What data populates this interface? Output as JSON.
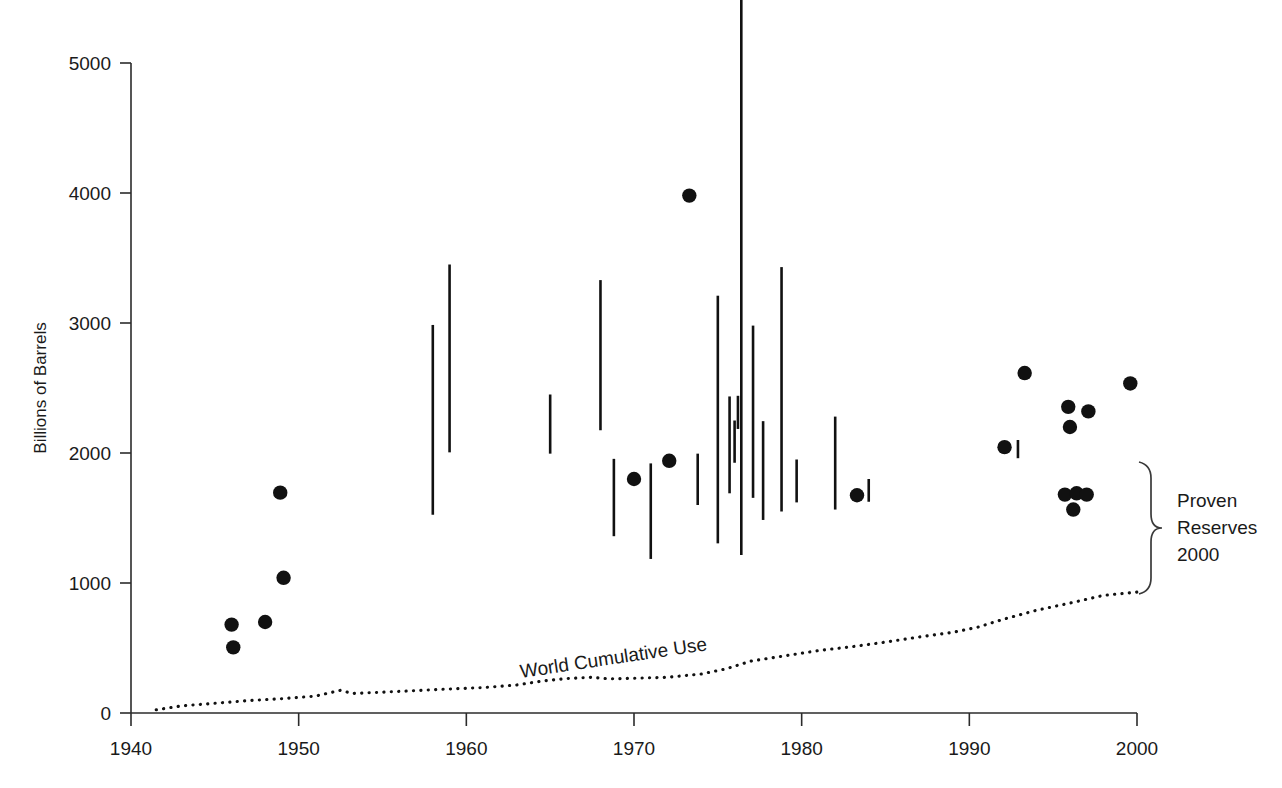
{
  "chart_data": {
    "type": "scatter",
    "title": "",
    "xlabel": "",
    "ylabel": "Billions of Barrels",
    "xlim": [
      1940,
      2000
    ],
    "ylim": [
      0,
      5000
    ],
    "xticks": [
      1940,
      1950,
      1960,
      1970,
      1980,
      1990,
      2000
    ],
    "yticks": [
      0,
      1000,
      2000,
      3000,
      4000,
      5000
    ],
    "grid": false,
    "legend_position": "none",
    "series": [
      {
        "name": "Point estimates of ultimately recoverable resources",
        "type": "scatter",
        "marker": "filled-circle",
        "color": "#111111",
        "points": [
          {
            "x": 1946.0,
            "y": 680
          },
          {
            "x": 1946.1,
            "y": 505
          },
          {
            "x": 1948.0,
            "y": 700
          },
          {
            "x": 1948.9,
            "y": 1695
          },
          {
            "x": 1949.1,
            "y": 1040
          },
          {
            "x": 1970.0,
            "y": 1800
          },
          {
            "x": 1972.1,
            "y": 1940
          },
          {
            "x": 1973.3,
            "y": 3980
          },
          {
            "x": 1983.3,
            "y": 1675
          },
          {
            "x": 1992.1,
            "y": 2045
          },
          {
            "x": 1993.3,
            "y": 2615
          },
          {
            "x": 1995.9,
            "y": 2355
          },
          {
            "x": 1996.0,
            "y": 2200
          },
          {
            "x": 1995.7,
            "y": 1680
          },
          {
            "x": 1996.4,
            "y": 1690
          },
          {
            "x": 1996.2,
            "y": 1565
          },
          {
            "x": 1997.0,
            "y": 1680
          },
          {
            "x": 1997.1,
            "y": 2320
          },
          {
            "x": 1999.6,
            "y": 2535
          }
        ]
      },
      {
        "name": "Range estimates of ultimately recoverable resources",
        "type": "range-bar",
        "color": "#111111",
        "bars": [
          {
            "x": 1958.0,
            "low": 1525,
            "high": 2985
          },
          {
            "x": 1959.0,
            "low": 2005,
            "high": 3450
          },
          {
            "x": 1965.0,
            "low": 1995,
            "high": 2450
          },
          {
            "x": 1968.0,
            "low": 2175,
            "high": 3330
          },
          {
            "x": 1968.8,
            "low": 1360,
            "high": 1955
          },
          {
            "x": 1971.0,
            "low": 1185,
            "high": 1920
          },
          {
            "x": 1973.8,
            "low": 1600,
            "high": 1995
          },
          {
            "x": 1975.0,
            "low": 1305,
            "high": 3210
          },
          {
            "x": 1975.7,
            "low": 1690,
            "high": 2435
          },
          {
            "x": 1976.0,
            "low": 1925,
            "high": 2250
          },
          {
            "x": 1976.2,
            "low": 2185,
            "high": 2440
          },
          {
            "x": 1976.4,
            "low": 1215,
            "high": 5900
          },
          {
            "x": 1977.1,
            "low": 1655,
            "high": 2980
          },
          {
            "x": 1977.7,
            "low": 1485,
            "high": 2245
          },
          {
            "x": 1978.8,
            "low": 1550,
            "high": 3430
          },
          {
            "x": 1979.7,
            "low": 1620,
            "high": 1950
          },
          {
            "x": 1982.0,
            "low": 1565,
            "high": 2280
          },
          {
            "x": 1984.0,
            "low": 1625,
            "high": 1800
          },
          {
            "x": 1992.9,
            "low": 1960,
            "high": 2100
          }
        ]
      },
      {
        "name": "World Cumulative Use",
        "type": "line",
        "style": "dotted",
        "color": "#111111",
        "label": "World Cumulative Use",
        "points": [
          {
            "x": 1941.5,
            "y": 25
          },
          {
            "x": 1943,
            "y": 55
          },
          {
            "x": 1945,
            "y": 75
          },
          {
            "x": 1947,
            "y": 95
          },
          {
            "x": 1949,
            "y": 110
          },
          {
            "x": 1951,
            "y": 130
          },
          {
            "x": 1952.5,
            "y": 175
          },
          {
            "x": 1953.2,
            "y": 150
          },
          {
            "x": 1955,
            "y": 160
          },
          {
            "x": 1957,
            "y": 172
          },
          {
            "x": 1959,
            "y": 185
          },
          {
            "x": 1961,
            "y": 195
          },
          {
            "x": 1963,
            "y": 215
          },
          {
            "x": 1964.5,
            "y": 245
          },
          {
            "x": 1966,
            "y": 265
          },
          {
            "x": 1967.5,
            "y": 275
          },
          {
            "x": 1968.5,
            "y": 262
          },
          {
            "x": 1970,
            "y": 268
          },
          {
            "x": 1972,
            "y": 275
          },
          {
            "x": 1974,
            "y": 300
          },
          {
            "x": 1975.5,
            "y": 340
          },
          {
            "x": 1977,
            "y": 400
          },
          {
            "x": 1979,
            "y": 440
          },
          {
            "x": 1981,
            "y": 480
          },
          {
            "x": 1983,
            "y": 510
          },
          {
            "x": 1985,
            "y": 545
          },
          {
            "x": 1987,
            "y": 585
          },
          {
            "x": 1989,
            "y": 620
          },
          {
            "x": 1990.5,
            "y": 660
          },
          {
            "x": 1992,
            "y": 720
          },
          {
            "x": 1994,
            "y": 790
          },
          {
            "x": 1996,
            "y": 845
          },
          {
            "x": 1998,
            "y": 905
          },
          {
            "x": 2000,
            "y": 930
          }
        ]
      }
    ],
    "annotations": [
      {
        "name": "proven-reserves-brace",
        "text_lines": [
          "Proven",
          "Reserves",
          "2000"
        ],
        "span_low": 930,
        "span_high": 1960,
        "at_x": 2000
      }
    ]
  },
  "axes": {
    "y_title": "Billions of Barrels",
    "y_ticks": [
      "0",
      "1000",
      "2000",
      "3000",
      "4000",
      "5000"
    ],
    "x_ticks": [
      "1940",
      "1950",
      "1960",
      "1970",
      "1980",
      "1990",
      "2000"
    ]
  },
  "labels": {
    "cumulative_use": "World Cumulative Use",
    "brace_line1": "Proven",
    "brace_line2": "Reserves",
    "brace_line3": "2000"
  },
  "colors": {
    "ink": "#111111",
    "axis": "#2b2b2b",
    "background": "#ffffff"
  }
}
